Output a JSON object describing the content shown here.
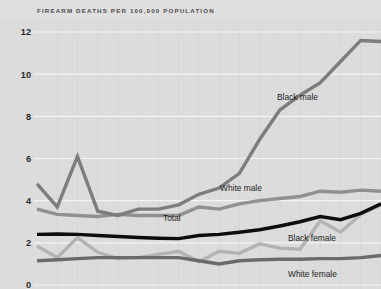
{
  "chart_data": {
    "type": "line",
    "title": "FIREARM DEATHS PER 100,000 POPULATION",
    "xlabel": "",
    "ylabel": "Firearm deaths per 100,000 population",
    "ylim": [
      0,
      12
    ],
    "yticks": [
      0,
      2,
      4,
      6,
      8,
      10,
      12
    ],
    "ytick_labels": [
      "0",
      "2",
      "4",
      "6",
      "8",
      "10",
      "12"
    ],
    "grid": "horizontal-white-major-and-faint-vertical",
    "legend_position": "inline-labels-on-plot",
    "x": [
      0,
      1,
      2,
      3,
      4,
      5,
      6,
      7,
      8,
      9,
      10,
      11,
      12,
      13,
      14,
      15,
      16,
      17
    ],
    "series": [
      {
        "name": "Black male",
        "label": "Black male",
        "color": "#7d7d7d",
        "width": 3.4,
        "label_x": 277,
        "label_y": 100,
        "values": [
          4.8,
          3.7,
          6.1,
          3.5,
          3.3,
          3.6,
          3.6,
          3.8,
          4.3,
          4.6,
          5.3,
          6.9,
          8.3,
          9.0,
          9.6,
          10.6,
          11.6,
          11.55
        ]
      },
      {
        "name": "White male",
        "label": "White male",
        "color": "#909090",
        "width": 3.4,
        "label_x": 220,
        "label_y": 191,
        "values": [
          3.6,
          3.35,
          3.3,
          3.25,
          3.35,
          3.3,
          3.3,
          3.3,
          3.7,
          3.6,
          3.85,
          4.0,
          4.1,
          4.2,
          4.45,
          4.4,
          4.5,
          4.45
        ]
      },
      {
        "name": "Total",
        "label": "Total",
        "color": "#0d0d0d",
        "width": 3.4,
        "label_x": 163,
        "label_y": 221,
        "values": [
          2.4,
          2.42,
          2.4,
          2.35,
          2.3,
          2.25,
          2.22,
          2.2,
          2.35,
          2.4,
          2.5,
          2.62,
          2.8,
          3.0,
          3.25,
          3.1,
          3.4,
          3.85
        ]
      },
      {
        "name": "Black female",
        "label": "Black female",
        "color": "#b3b3b3",
        "width": 3.4,
        "label_x": 288,
        "label_y": 241,
        "values": [
          1.85,
          1.3,
          2.25,
          1.55,
          1.25,
          1.3,
          1.45,
          1.6,
          1.1,
          1.6,
          1.5,
          1.95,
          1.75,
          1.7,
          3.05,
          2.5,
          3.35,
          3.8
        ]
      },
      {
        "name": "White female",
        "label": "White female",
        "color": "#6b6b6b",
        "width": 3.4,
        "label_x": 288,
        "label_y": 277,
        "values": [
          1.15,
          1.2,
          1.25,
          1.3,
          1.3,
          1.3,
          1.3,
          1.3,
          1.15,
          1.0,
          1.15,
          1.2,
          1.22,
          1.22,
          1.25,
          1.25,
          1.3,
          1.4
        ]
      }
    ]
  },
  "figure": {
    "background": "#dcdcdc",
    "header_background": "#dfdfdf",
    "gridline_color": "#f4f4f4",
    "vertical_gridline_color": "#d6d6d6",
    "title_color": "#4d4d4d",
    "tick_color": "#2b2b2b"
  },
  "geometry": {
    "plot_left": 37,
    "plot_right": 381,
    "y_top_px": 32,
    "y_bottom_px": 285
  }
}
